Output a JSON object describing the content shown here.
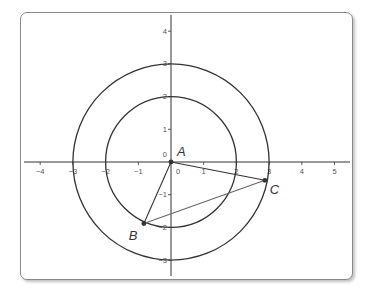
{
  "chart_data": {
    "type": "diagram",
    "title": "",
    "axes": {
      "x_ticks": [
        -4,
        -3,
        -2,
        -1,
        0,
        1,
        2,
        3,
        4,
        5
      ],
      "y_ticks": [
        -3,
        -2,
        -1,
        0,
        1,
        2,
        3,
        4
      ],
      "x_range": [
        -4.5,
        5.6
      ],
      "y_range": [
        -3.5,
        4.5
      ],
      "grid": false
    },
    "circles": [
      {
        "name": "inner-circle",
        "center": [
          0,
          0
        ],
        "radius": 2
      },
      {
        "name": "outer-circle",
        "center": [
          0,
          0
        ],
        "radius": 3
      }
    ],
    "points": [
      {
        "label": "A",
        "x": 0,
        "y": 0
      },
      {
        "label": "B",
        "x": -0.83,
        "y": -1.88
      },
      {
        "label": "C",
        "x": 2.87,
        "y": -0.56
      }
    ],
    "segments": [
      {
        "from": "A",
        "to": "B"
      },
      {
        "from": "A",
        "to": "C"
      },
      {
        "from": "B",
        "to": "C"
      }
    ]
  },
  "colors": {
    "line": "#333333",
    "segment_bc": "#666666",
    "frame_border": "#8a8a8a",
    "tick_text": "#555555"
  }
}
